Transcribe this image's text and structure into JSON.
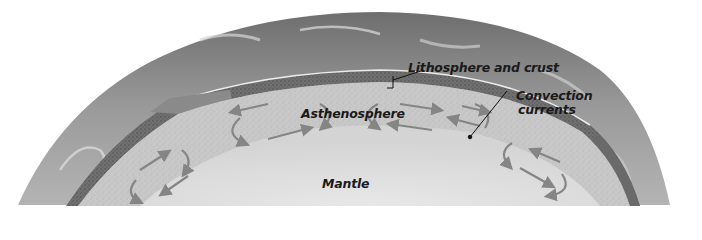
{
  "diagram": {
    "labels": {
      "lithosphere": "Lithosphere and crust",
      "convection_line1": "Convection",
      "convection_line2": "currents",
      "asthenosphere": "Asthenosphere",
      "mantle": "Mantle"
    },
    "layers": [
      {
        "name": "Atmosphere / surface",
        "color": "#8c8c8c"
      },
      {
        "name": "Lithosphere and crust",
        "color": "#7a7a7a"
      },
      {
        "name": "Asthenosphere",
        "color": "#c9c9c9"
      },
      {
        "name": "Mantle",
        "color": "#dedede"
      }
    ],
    "colors": {
      "arrow": "#858585",
      "leader_line": "#111111",
      "text": "#1a1a1a"
    }
  }
}
